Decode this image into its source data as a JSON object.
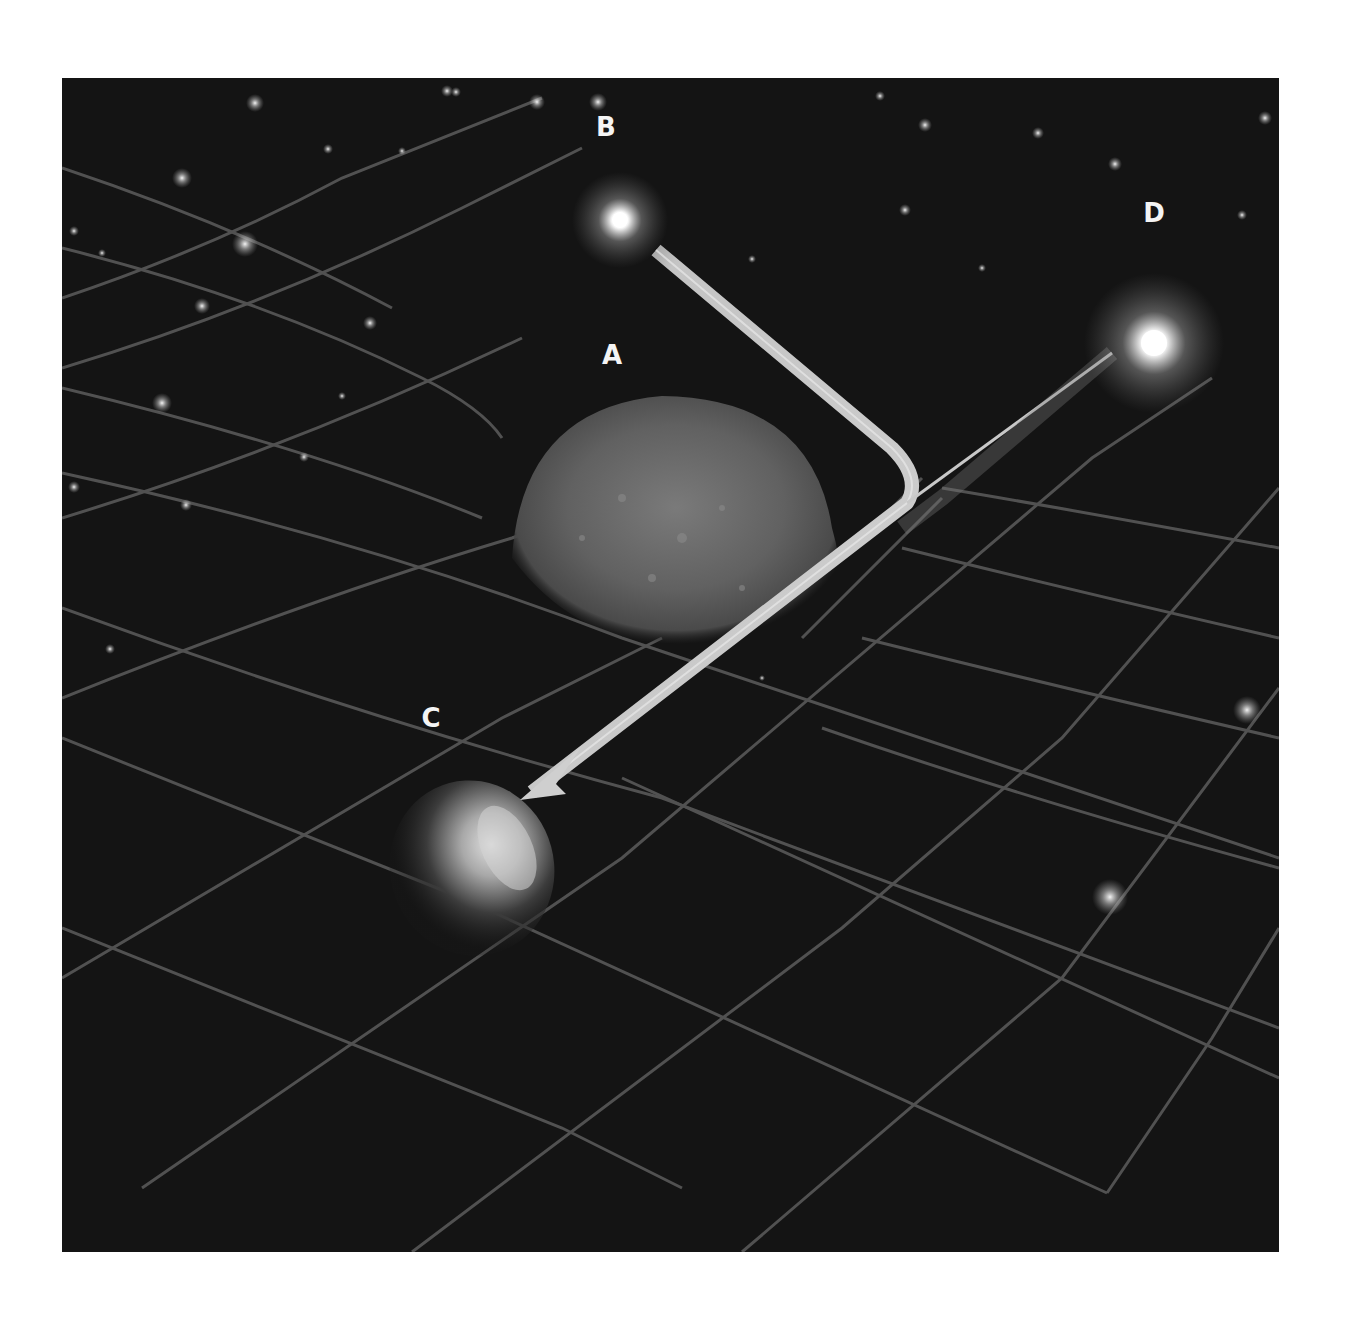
{
  "figure": {
    "background_color": "#141414",
    "grid_color": "#5a5a5a",
    "path_color": "#c8c8c8"
  },
  "labels": {
    "A": "A",
    "B": "B",
    "C": "C",
    "D": "D"
  },
  "objects": [
    {
      "id": "A",
      "kind": "massive-body",
      "description": "Large cratered planet/galaxy deforming the spacetime grid"
    },
    {
      "id": "B",
      "kind": "light-source",
      "description": "Bright star emitting a light ray that bends around A"
    },
    {
      "id": "C",
      "kind": "observer-body",
      "description": "Small planet receiving the bent light (arrow tip)"
    },
    {
      "id": "D",
      "kind": "apparent-source",
      "description": "Apparent position of star seen from C along straight line"
    }
  ]
}
